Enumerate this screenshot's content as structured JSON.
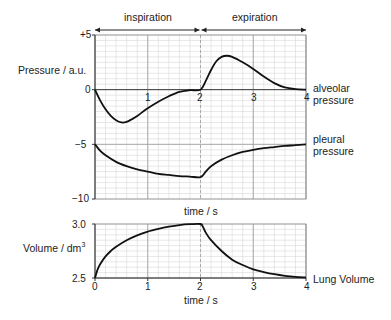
{
  "chart_data": [
    {
      "type": "line",
      "title": "",
      "phases": [
        {
          "label": "inspiration",
          "from": 0,
          "to": 2
        },
        {
          "label": "expiration",
          "from": 2,
          "to": 4
        }
      ],
      "xlabel": "time / s",
      "ylabel": "Pressure / a.u.",
      "xlim": [
        0,
        4
      ],
      "ylim": [
        -10,
        5
      ],
      "x_ticks": [
        "0",
        "1",
        "2",
        "3",
        "4"
      ],
      "y_ticks": [
        "+5",
        "0",
        "−5",
        "−10"
      ],
      "grid": true,
      "series": [
        {
          "name": "alveolar pressure",
          "x": [
            0,
            0.1,
            0.2,
            0.3,
            0.4,
            0.5,
            0.6,
            0.7,
            0.8,
            1.0,
            1.2,
            1.4,
            1.6,
            1.8,
            2.0,
            2.1,
            2.2,
            2.3,
            2.4,
            2.5,
            2.6,
            2.8,
            3.0,
            3.2,
            3.4,
            3.6,
            3.8,
            4.0
          ],
          "values": [
            0,
            -1.0,
            -1.8,
            -2.4,
            -2.8,
            -3.0,
            -2.95,
            -2.7,
            -2.4,
            -1.7,
            -1.1,
            -0.6,
            -0.2,
            -0.05,
            0,
            0.8,
            1.8,
            2.6,
            3.0,
            3.1,
            3.0,
            2.5,
            1.9,
            1.2,
            0.6,
            0.2,
            0.05,
            0
          ]
        },
        {
          "name": "pleural pressure",
          "x": [
            0,
            0.1,
            0.2,
            0.4,
            0.6,
            0.8,
            1.0,
            1.2,
            1.4,
            1.6,
            1.8,
            2.0,
            2.1,
            2.2,
            2.4,
            2.6,
            2.8,
            3.0,
            3.2,
            3.4,
            3.6,
            3.8,
            4.0
          ],
          "values": [
            -5,
            -5.6,
            -6.0,
            -6.6,
            -7.0,
            -7.3,
            -7.5,
            -7.7,
            -7.8,
            -7.9,
            -7.95,
            -8.0,
            -7.5,
            -7.0,
            -6.4,
            -6.0,
            -5.7,
            -5.5,
            -5.35,
            -5.25,
            -5.15,
            -5.08,
            -5.0
          ]
        }
      ]
    },
    {
      "type": "line",
      "title": "",
      "xlabel": "time / s",
      "ylabel": "Volume / dm³",
      "xlim": [
        0,
        4
      ],
      "ylim": [
        2.5,
        3.0
      ],
      "x_ticks": [
        "0",
        "1",
        "2",
        "3",
        "4"
      ],
      "y_ticks": [
        "3.0",
        "2.5"
      ],
      "grid": true,
      "series": [
        {
          "name": "Lung Volume",
          "x": [
            0,
            0.05,
            0.1,
            0.2,
            0.3,
            0.4,
            0.6,
            0.8,
            1.0,
            1.2,
            1.4,
            1.6,
            1.8,
            2.0,
            2.05,
            2.1,
            2.2,
            2.4,
            2.6,
            2.8,
            3.0,
            3.2,
            3.4,
            3.6,
            3.8,
            4.0
          ],
          "values": [
            2.5,
            2.58,
            2.63,
            2.7,
            2.75,
            2.79,
            2.85,
            2.895,
            2.93,
            2.955,
            2.975,
            2.99,
            2.998,
            3.0,
            2.97,
            2.92,
            2.85,
            2.75,
            2.67,
            2.62,
            2.58,
            2.555,
            2.535,
            2.52,
            2.51,
            2.505
          ]
        }
      ]
    }
  ],
  "labels": {
    "inspiration": "inspiration",
    "expiration": "expiration",
    "pressure_axis": "Pressure / a.u.",
    "volume_axis": "Volume / dm",
    "volume_sup": "3",
    "time_upper": "time / s",
    "time_lower": "time / s",
    "alveolar_1": "alveolar",
    "alveolar_2": "pressure",
    "pleural_1": "pleural",
    "pleural_2": "pressure",
    "lung_volume": "Lung Volume"
  },
  "ticks": {
    "p_plus5": "+5",
    "p_zero": "0",
    "p_minus5": "−5",
    "p_minus10": "−10",
    "v_3": "3.0",
    "v_25": "2.5",
    "x_upper": [
      "1",
      "2",
      "3",
      "4"
    ],
    "x_lower": [
      "0",
      "1",
      "2",
      "3",
      "4"
    ]
  }
}
